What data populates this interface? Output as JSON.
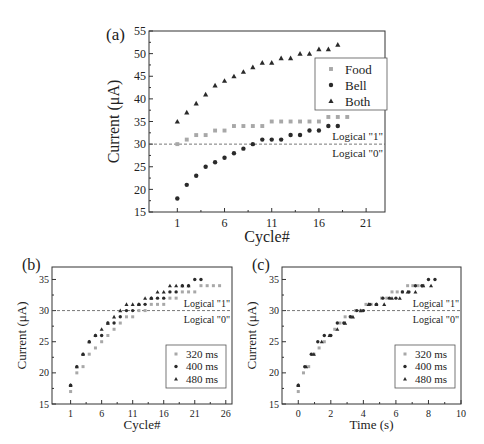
{
  "chart_data": [
    {
      "panel": "(a)",
      "type": "scatter",
      "title": "",
      "xlabel": "Cycle#",
      "ylabel": "Current (μA)",
      "xlim": [
        -2,
        23
      ],
      "ylim": [
        15,
        55
      ],
      "xticks": [
        1,
        6,
        11,
        16,
        21
      ],
      "yticks": [
        15,
        20,
        25,
        30,
        35,
        40,
        45,
        50,
        55
      ],
      "grid": false,
      "legend_position": "upper right",
      "threshold": {
        "y": 30,
        "label_above": "Logical \"1\"",
        "label_below": "Logical \"0\""
      },
      "series": [
        {
          "name": "Food",
          "marker": "square",
          "color": "#a8a8a8",
          "x": [
            1,
            2,
            3,
            4,
            5,
            6,
            7,
            8,
            9,
            10,
            11,
            12,
            13,
            14,
            15,
            16,
            17,
            18,
            19
          ],
          "y": [
            30,
            31,
            32,
            32,
            33,
            33,
            34,
            34,
            34,
            34,
            35,
            35,
            35,
            35,
            35,
            35,
            36,
            36,
            36
          ]
        },
        {
          "name": "Bell",
          "marker": "circle",
          "color": "#2a2a2a",
          "x": [
            1,
            2,
            3,
            4,
            5,
            6,
            7,
            8,
            9,
            10,
            11,
            12,
            13,
            14,
            15,
            16,
            17,
            18
          ],
          "y": [
            18,
            21,
            23,
            25,
            26,
            27,
            28,
            29,
            30,
            31,
            31,
            31,
            32,
            32,
            33,
            33,
            34,
            34
          ]
        },
        {
          "name": "Both",
          "marker": "triangle",
          "color": "#2a2a2a",
          "x": [
            1,
            2,
            3,
            4,
            5,
            6,
            7,
            8,
            9,
            10,
            11,
            12,
            13,
            14,
            15,
            16,
            17,
            18
          ],
          "y": [
            35,
            37,
            39,
            41,
            43,
            44,
            45,
            46,
            47,
            48,
            48,
            49,
            49,
            50,
            50,
            51,
            51,
            52
          ]
        }
      ]
    },
    {
      "panel": "(b)",
      "type": "scatter",
      "title": "",
      "xlabel": "Cycle#",
      "ylabel": "Current (μA)",
      "xlim": [
        -2,
        27
      ],
      "ylim": [
        15,
        37
      ],
      "xticks": [
        1,
        6,
        11,
        16,
        21,
        26
      ],
      "yticks": [
        15,
        20,
        25,
        30,
        35
      ],
      "grid": false,
      "legend_position": "lower right",
      "threshold": {
        "y": 30,
        "label_above": "Logical \"1\"",
        "label_below": "Logical \"0\""
      },
      "series": [
        {
          "name": "320 ms",
          "marker": "square",
          "color": "#a8a8a8",
          "x": [
            1,
            2,
            3,
            4,
            5,
            6,
            7,
            8,
            9,
            10,
            11,
            12,
            13,
            14,
            15,
            16,
            17,
            18,
            19,
            20,
            21,
            22,
            23,
            24,
            25
          ],
          "y": [
            17,
            20,
            21,
            23,
            24,
            25,
            26,
            27,
            28,
            29,
            29,
            30,
            30,
            31,
            31,
            31,
            32,
            32,
            33,
            33,
            33,
            34,
            34,
            34,
            34
          ]
        },
        {
          "name": "400 ms",
          "marker": "circle",
          "color": "#2a2a2a",
          "x": [
            1,
            2,
            3,
            4,
            5,
            6,
            7,
            8,
            9,
            10,
            11,
            12,
            13,
            14,
            15,
            16,
            17,
            18,
            19,
            20,
            21,
            22
          ],
          "y": [
            18,
            21,
            23,
            25,
            26,
            26,
            28,
            28,
            29,
            30,
            30,
            31,
            31,
            32,
            32,
            32,
            33,
            33,
            34,
            34,
            35,
            35
          ]
        },
        {
          "name": "480 ms",
          "marker": "triangle",
          "color": "#2a2a2a",
          "x": [
            1,
            2,
            3,
            4,
            5,
            6,
            7,
            8,
            9,
            10,
            11,
            12,
            13,
            14,
            15,
            16,
            17,
            18,
            19,
            20
          ],
          "y": [
            18,
            21,
            23,
            25,
            26,
            27,
            28,
            29,
            30,
            31,
            31,
            31,
            32,
            32,
            33,
            33,
            34,
            34,
            34,
            34
          ]
        }
      ]
    },
    {
      "panel": "(c)",
      "type": "scatter",
      "title": "",
      "xlabel": "Time (s)",
      "ylabel": "Current (μA)",
      "xlim": [
        -1,
        10
      ],
      "ylim": [
        15,
        37
      ],
      "xticks": [
        0,
        2,
        4,
        6,
        8,
        10
      ],
      "yticks": [
        15,
        20,
        25,
        30,
        35
      ],
      "grid": false,
      "legend_position": "lower right",
      "threshold": {
        "y": 30,
        "label_above": "Logical \"1\"",
        "label_below": "Logical \"0\""
      },
      "series": [
        {
          "name": "320 ms",
          "marker": "square",
          "color": "#a8a8a8",
          "x": [
            0,
            0.32,
            0.64,
            0.96,
            1.28,
            1.6,
            1.92,
            2.24,
            2.56,
            2.88,
            3.2,
            3.52,
            3.84,
            4.16,
            4.48,
            4.8,
            5.12,
            5.44,
            5.76,
            6.08,
            6.4,
            6.72,
            7.04,
            7.36,
            7.68
          ],
          "y": [
            17,
            20,
            21,
            23,
            24,
            25,
            26,
            27,
            28,
            29,
            29,
            30,
            30,
            31,
            31,
            31,
            32,
            32,
            33,
            33,
            33,
            34,
            34,
            34,
            34
          ]
        },
        {
          "name": "400 ms",
          "marker": "circle",
          "color": "#2a2a2a",
          "x": [
            0,
            0.4,
            0.8,
            1.2,
            1.6,
            2.0,
            2.4,
            2.8,
            3.2,
            3.6,
            4.0,
            4.4,
            4.8,
            5.2,
            5.6,
            6.0,
            6.4,
            6.8,
            7.2,
            7.6,
            8.0,
            8.4
          ],
          "y": [
            18,
            21,
            23,
            25,
            26,
            26,
            28,
            28,
            29,
            30,
            30,
            31,
            31,
            32,
            32,
            32,
            33,
            33,
            34,
            34,
            35,
            35
          ]
        },
        {
          "name": "480 ms",
          "marker": "triangle",
          "color": "#2a2a2a",
          "x": [
            0,
            0.48,
            0.96,
            1.44,
            1.92,
            2.4,
            2.88,
            3.36,
            3.84,
            4.32,
            4.8,
            5.28,
            5.76,
            6.24,
            6.72,
            7.2,
            7.68,
            8.16
          ],
          "y": [
            18,
            21,
            23,
            25,
            26,
            27,
            28,
            29,
            30,
            31,
            31,
            31,
            32,
            32,
            33,
            33,
            34,
            34
          ]
        }
      ]
    }
  ],
  "labels": {
    "panel_a": "(a)",
    "panel_b": "(b)",
    "panel_c": "(c)"
  }
}
